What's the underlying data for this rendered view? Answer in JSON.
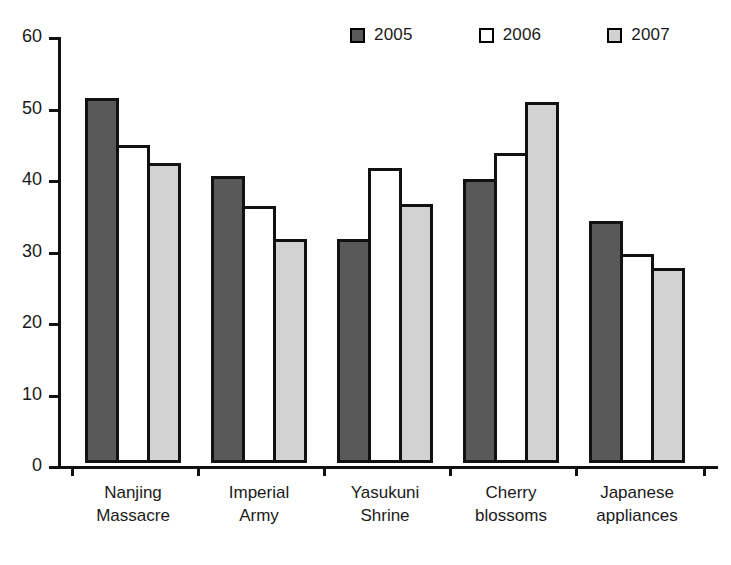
{
  "chart_data": {
    "type": "bar",
    "title": "",
    "subtitle": "",
    "xlabel": "",
    "ylabel": "",
    "ylim": [
      0,
      60
    ],
    "ytick_values": [
      60,
      50,
      40,
      30,
      20,
      10,
      0
    ],
    "ytick_labels": [
      "60",
      "50",
      "40",
      "30",
      "20",
      "10",
      "0"
    ],
    "grid": false,
    "legend_position": "top-right",
    "categories": [
      "Nanjing Massacre",
      "Imperial Army",
      "Yasukuni Shrine",
      "Cherry blossoms",
      "Japanese appliances"
    ],
    "category_lines": [
      [
        "Nanjing",
        "Massacre"
      ],
      [
        "Imperial",
        "Army"
      ],
      [
        "Yasukuni",
        "Shrine"
      ],
      [
        "Cherry",
        "blossoms"
      ],
      [
        "Japanese",
        "appliances"
      ]
    ],
    "series": [
      {
        "name": "2005",
        "color": "#595959",
        "values": [
          51.0,
          40.2,
          31.3,
          39.7,
          33.8
        ]
      },
      {
        "name": "2006",
        "color": "#ffffff",
        "values": [
          44.5,
          36.0,
          41.2,
          43.3,
          29.3
        ]
      },
      {
        "name": "2007",
        "color": "#d2d2d2",
        "values": [
          42.0,
          31.3,
          36.2,
          50.5,
          27.3
        ]
      }
    ]
  },
  "legend": {
    "items": [
      {
        "label": "2005",
        "color": "#595959"
      },
      {
        "label": "2006",
        "color": "#ffffff"
      },
      {
        "label": "2007",
        "color": "#d2d2d2"
      }
    ]
  },
  "axis": {
    "border_color": "#111111"
  }
}
